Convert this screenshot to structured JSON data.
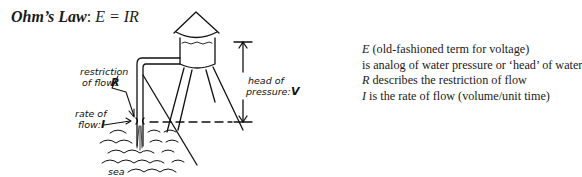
{
  "title": {
    "label": "Ohm’s Law",
    "separator": ": ",
    "equation": "E = IR"
  },
  "diagram": {
    "labels": {
      "restriction_line1": "restriction",
      "restriction_line2": "of flow:",
      "restriction_var": "R",
      "rate_line1": "rate of",
      "rate_line2": "flow:",
      "rate_var": "I",
      "head_line1": "head of",
      "head_line2": "pressure:",
      "head_var": "V",
      "sea": "sea"
    }
  },
  "legend": {
    "items": [
      {
        "var": "E",
        "text": " (old-fashioned term for voltage)"
      },
      {
        "var": "",
        "text": "is analog of water pressure or ‘head’ of water"
      },
      {
        "var": "R",
        "text": " describes the restriction of flow"
      },
      {
        "var": "I",
        "text": " is the rate of flow (volume/unit time)"
      }
    ]
  }
}
